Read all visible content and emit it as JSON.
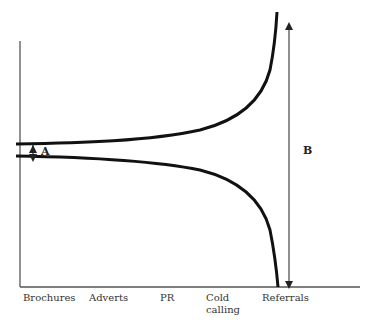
{
  "diagram": {
    "type": "funnel-divergence",
    "x_axis": {
      "categories": [
        "Brochures",
        "Adverts",
        "PR",
        "Cold\ncalling",
        "Referrals"
      ],
      "labels": {
        "brochures": "Brochures",
        "adverts": "Adverts",
        "pr": "PR",
        "cold_calling_1": "Cold",
        "cold_calling_2": "calling",
        "referrals": "Referrals"
      }
    },
    "annotations": {
      "gap_small": "A",
      "gap_large": "B"
    },
    "colors": {
      "curve": "#111111",
      "axis": "#555555",
      "arrow": "#333333",
      "text": "#333333"
    }
  }
}
